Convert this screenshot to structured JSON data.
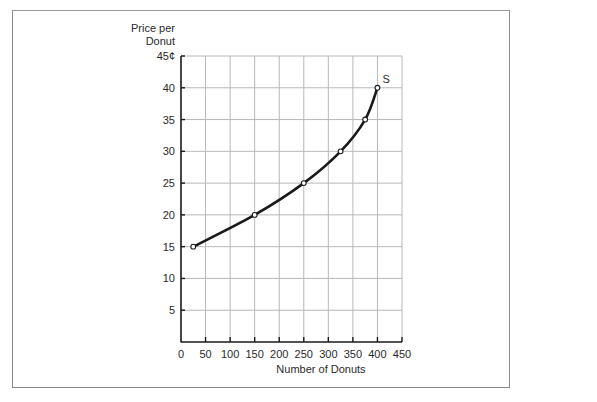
{
  "chart_data": {
    "type": "line",
    "title": "",
    "xlabel": "Number of Donuts",
    "ylabel": "Price per Donut",
    "ylabel_lines": [
      "Price per",
      "Donut"
    ],
    "xlim": [
      0,
      450
    ],
    "ylim": [
      0,
      45
    ],
    "x_ticks": [
      0,
      50,
      100,
      150,
      200,
      250,
      300,
      350,
      400,
      450
    ],
    "y_ticks": [
      5,
      10,
      15,
      20,
      25,
      30,
      35,
      40,
      45
    ],
    "y_tick_labels": [
      "5",
      "10",
      "15",
      "20",
      "25",
      "30",
      "35",
      "40",
      "45¢"
    ],
    "grid": true,
    "series": [
      {
        "name": "S",
        "x": [
          25,
          150,
          250,
          325,
          375,
          400
        ],
        "y": [
          15,
          20,
          25,
          30,
          35,
          40
        ],
        "markers": "open-circle",
        "label": "S"
      }
    ]
  },
  "colors": {
    "line": "#1a1a1a",
    "grid": "#b8b8b8",
    "axis": "#1a1a1a",
    "frame": "#8a8a8a"
  }
}
